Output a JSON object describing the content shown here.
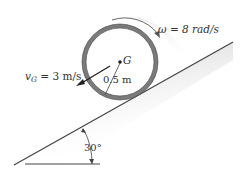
{
  "diagram": {
    "omega_label": "ω = 8 rad/s",
    "velocity_label_prefix": "v",
    "velocity_label_sub": "G",
    "velocity_label_suffix": " = 3 m/s",
    "radius_label": "0.5 m",
    "center_label": "G",
    "angle_label": "30°"
  },
  "colors": {
    "ring": "#7a7a7a",
    "ring_edge": "#333333",
    "incline": "#444444",
    "shade": "#d9d9d9",
    "text": "#333333"
  }
}
